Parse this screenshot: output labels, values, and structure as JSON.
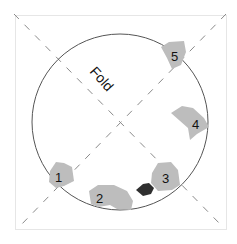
{
  "diagram": {
    "fold_label": "Fold",
    "colors": {
      "frame": "#e6e6e6",
      "circle": "#555555",
      "fold_line": "#8a8a8a",
      "fragment_fill": "#bdbdbd",
      "dark_fragment": "#2f2f2f",
      "label": "#111111"
    },
    "fragments": [
      {
        "id": "1",
        "label": "1"
      },
      {
        "id": "2",
        "label": "2"
      },
      {
        "id": "3",
        "label": "3"
      },
      {
        "id": "4",
        "label": "4"
      },
      {
        "id": "5",
        "label": "5"
      }
    ]
  }
}
